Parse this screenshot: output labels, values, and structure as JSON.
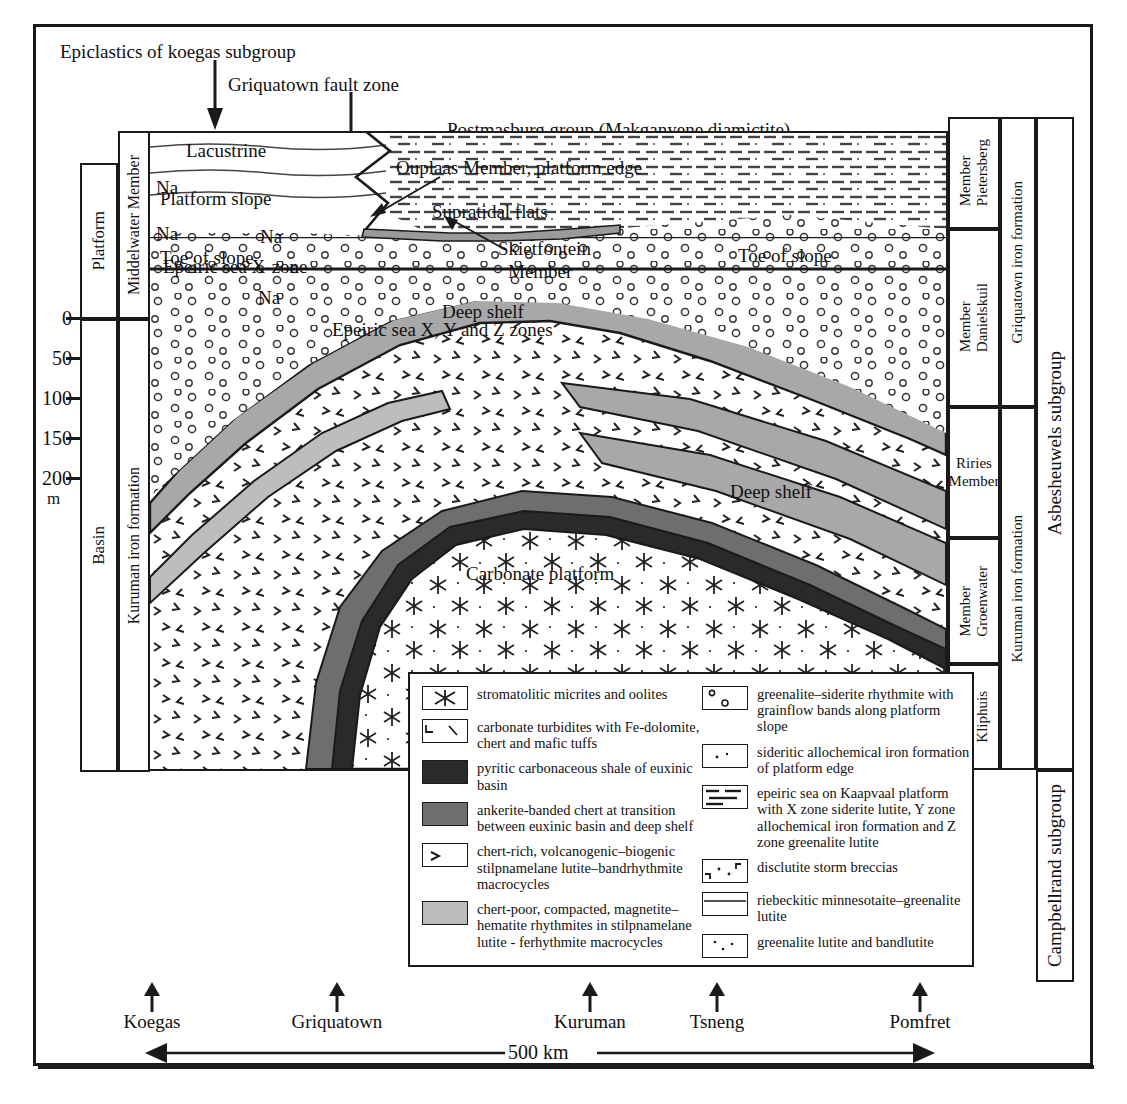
{
  "figure": {
    "title_caption": "",
    "outer_frame": true
  },
  "annotations": {
    "epiclastics": "Epiclastics of koegas subgroup",
    "fault_zone": "Griquatown fault zone",
    "postmasburg": "Postmasburg group (Makganyene diamictite)",
    "lacustrine": "Lacustrine",
    "supratidal": "Supratidal flats",
    "skietfontein": "Skietfontein\nMember",
    "skietfontein_l1": "Skietfontein",
    "skietfontein_l2": "Member",
    "epeiric_x": "Epeiric sea X-zone",
    "epeiric_xyz": "Epeiric sea X, Y and Z zones",
    "ouplaas": "Ouplaas Member, platform edge",
    "platform_slope": "Platform slope",
    "toe_of_slope_left": "Toe of slope",
    "toe_of_slope_right": "Toe of slope",
    "deep_shelf_upper": "Deep shelf",
    "deep_shelf_lower": "Deep shelf",
    "carbonate_platform": "Carbonate platform",
    "na": "Na"
  },
  "left_columns": {
    "environment": [
      {
        "label": "Platform"
      },
      {
        "label": "Basin"
      }
    ],
    "units": [
      {
        "label": "Middelwater Member"
      },
      {
        "label": "Kuruman iron formation"
      }
    ]
  },
  "right_columns": {
    "members": [
      {
        "label_lines": [
          "Pietersberg",
          "Member"
        ]
      },
      {
        "label_lines": [
          "Danielskuil",
          "Member"
        ]
      },
      {
        "label_lines": [
          "Riries",
          "Member"
        ]
      },
      {
        "label_lines": [
          "Groenwater",
          "Member"
        ]
      },
      {
        "label_lines": [
          "Kliphuis",
          "Member"
        ]
      }
    ],
    "formations": [
      {
        "label": "Griquatown iron formation"
      },
      {
        "label": "Kuruman iron formation"
      }
    ],
    "subgroups": [
      {
        "label": "Asbesheuwels subgroup"
      },
      {
        "label": "Campbellrand subgroup"
      }
    ]
  },
  "depth_scale": {
    "ticks": [
      "0",
      "50",
      "100",
      "150",
      "200"
    ],
    "unit": "m"
  },
  "localities": [
    {
      "name": "Koegas"
    },
    {
      "name": "Griquatown"
    },
    {
      "name": "Kuruman"
    },
    {
      "name": "Tsneng"
    },
    {
      "name": "Pomfret"
    }
  ],
  "scale_bar": {
    "label": "500 km"
  },
  "legend": {
    "left": [
      {
        "swatch": "stromatolite-swatch",
        "fill": "#ffffff",
        "text": "stromatolitic micrites and oolites"
      },
      {
        "swatch": "carbonate-turbidite-swatch",
        "fill": "#ffffff",
        "text": "carbonate turbidites with Fe-dolomite, chert and mafic tuffs"
      },
      {
        "swatch": "pyritic-shale-swatch",
        "fill": "#2a2a2a",
        "text": "pyritic carbonaceous shale of euxinic basin"
      },
      {
        "swatch": "ankerite-chert-swatch",
        "fill": "#6e6e6e",
        "text": "ankerite-banded chert at transition between euxinic basin and deep shelf"
      },
      {
        "swatch": "chert-rich-swatch",
        "fill": "#ffffff",
        "text": "chert-rich, volcanogenic–biogenic stilpnamelane lutite–bandrhythmite macrocycles"
      },
      {
        "swatch": "chert-poor-swatch",
        "fill": "#b5b5b5",
        "text": "chert-poor, compacted, magnetite–hematite rhythmites in stilpnamelane lutite - ferhythmite macrocycles"
      }
    ],
    "right": [
      {
        "swatch": "greenalite-siderite-swatch",
        "fill": "#ffffff",
        "text": "greenalite–siderite rhythmite with grainflow bands along platform slope"
      },
      {
        "swatch": "sideritic-allochem-swatch",
        "fill": "#ffffff",
        "text": "sideritic allochemical iron formation of platform edge"
      },
      {
        "swatch": "epeiric-sea-swatch",
        "fill": "#ffffff",
        "text": "epeiric sea on Kaapvaal platform with X zone siderite lutite, Y zone allochemical iron formation and Z zone greenalite lutite"
      },
      {
        "swatch": "disclutite-swatch",
        "fill": "#ffffff",
        "text": "disclutite storm breccias"
      },
      {
        "swatch": "riebeckitic-swatch",
        "fill": "#ffffff",
        "text": "riebeckitic minnesotaite–greenalite lutite"
      },
      {
        "swatch": "greenalite-lutite-swatch",
        "fill": "#ffffff",
        "text": "greenalite lutite and bandlutite"
      }
    ]
  },
  "colors": {
    "ink": "#1a1a1a",
    "dark_shale": "#2a2a2a",
    "ankerite": "#6e6e6e",
    "deep_shelf": "#a8a8a8",
    "chert_poor": "#bdbdbd",
    "paper": "#ffffff"
  }
}
